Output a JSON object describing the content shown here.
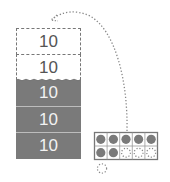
{
  "diagram": {
    "type": "place-value regrouping",
    "stack": {
      "empty_blocks": [
        {
          "label": "10"
        },
        {
          "label": "10"
        }
      ],
      "filled_blocks": [
        {
          "label": "10"
        },
        {
          "label": "10"
        },
        {
          "label": "10"
        }
      ]
    },
    "ten_frame": {
      "rows": 2,
      "cols": 5,
      "filled_counters": 7,
      "empty_dotted_counters": 3,
      "extra_dotted_counter_below": 1
    },
    "arrow": {
      "from": "ten-frame",
      "to": "empty-block-stack",
      "style": "dotted curve"
    },
    "colors": {
      "filled_block": "#7a7a7a",
      "counter": "#7a7a7a",
      "outline": "#777777",
      "text_on_filled": "#f2f2f2",
      "text_on_empty": "#555555"
    }
  }
}
